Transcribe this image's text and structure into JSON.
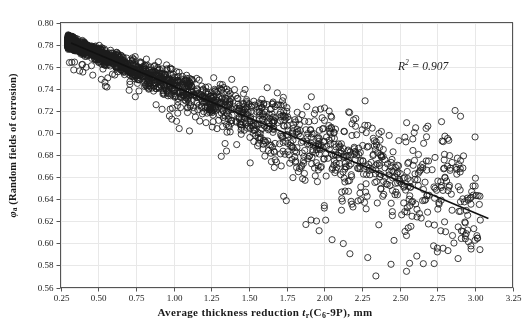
{
  "chart_data": {
    "type": "scatter",
    "title": "",
    "xlabel": "Average thickness reduction t r(C6-9P),  mm",
    "ylabel": "φa (Random fields of corrosion)",
    "xlim": [
      0.25,
      3.25
    ],
    "ylim": [
      0.56,
      0.8
    ],
    "xticks": [
      "0.25",
      "0.50",
      "0.75",
      "1.00",
      "1.25",
      "1.50",
      "1.75",
      "2.00",
      "2.25",
      "2.50",
      "2.75",
      "3.00",
      "3.25"
    ],
    "yticks": [
      "0.80",
      "0.78",
      "0.76",
      "0.74",
      "0.72",
      "0.70",
      "0.68",
      "0.66",
      "0.64",
      "0.62",
      "0.60",
      "0.58",
      "0.56"
    ],
    "xtick_values": [
      0.25,
      0.5,
      0.75,
      1.0,
      1.25,
      1.5,
      1.75,
      2.0,
      2.25,
      2.5,
      2.75,
      3.0,
      3.25
    ],
    "ytick_values": [
      0.8,
      0.78,
      0.76,
      0.74,
      0.72,
      0.7,
      0.68,
      0.66,
      0.64,
      0.62,
      0.6,
      0.58,
      0.56
    ],
    "grid": true,
    "grid_color": "#e8e8e8",
    "legend": "none",
    "marker": "open-circle",
    "marker_color": "#1c1c1c",
    "marker_size": 3.1,
    "series": [
      {
        "name": "Random fields of corrosion",
        "n_points": 2400,
        "description": "Dense downward-sloping band of open circles from (0.30, 0.783) to (3.05, 0.565) with widening vertical scatter at higher thickness reduction",
        "band": {
          "x_start": 0.3,
          "x_end": 3.05,
          "mean_at_x_start": 0.7825,
          "mean_at_x_end": 0.627,
          "spread_at_x_start": 0.0025,
          "spread_at_x_end": 0.034,
          "density_decay": 2.6
        }
      }
    ],
    "trendline": {
      "type": "linear",
      "x_from": 0.32,
      "x_to": 3.09,
      "y_from": 0.7815,
      "y_to": 0.6225,
      "color": "#111111",
      "width": 1.6
    },
    "annotations": [
      {
        "name": "r-squared",
        "text_prefix": "R",
        "text_sup": "2",
        "text_suffix": " = 0.907",
        "x": 2.55,
        "y": 0.757
      }
    ],
    "axis": {
      "frame_color": "#555555",
      "tick_color": "#555555",
      "tick_label_size": 9
    }
  },
  "labels": {
    "ylabel_phi": "φ",
    "ylabel_sub": "a",
    "ylabel_rest": " (Random fields of corrosion)",
    "xlabel_main": "Average thickness reduction ",
    "xlabel_t": "t",
    "xlabel_sub_r": "r",
    "xlabel_paren_open": "(C",
    "xlabel_sub_6": "6",
    "xlabel_paren_rest": "-9P),  mm",
    "r2_prefix": "R",
    "r2_sup": "2",
    "r2_value": " = 0.907"
  }
}
